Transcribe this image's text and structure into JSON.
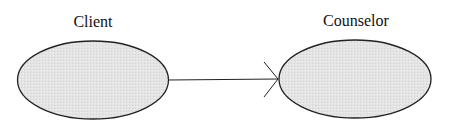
{
  "diagram": {
    "nodes": [
      {
        "id": "client",
        "label": "Client",
        "shape": "ellipse"
      },
      {
        "id": "counselor",
        "label": "Counselor",
        "shape": "ellipse"
      }
    ],
    "edges": [
      {
        "from": "client",
        "to": "counselor",
        "arrowhead": "open"
      }
    ],
    "colors": {
      "node_fill": "#e6e6e6",
      "stroke": "#222222",
      "background": "#ffffff"
    }
  }
}
